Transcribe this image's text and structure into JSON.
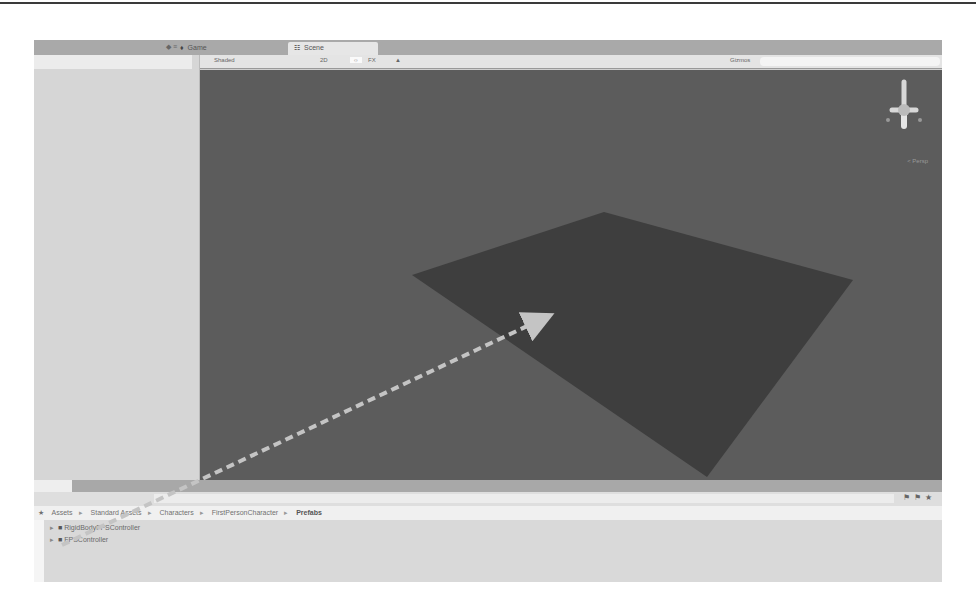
{
  "tabs": {
    "game": {
      "icon": "game-controller-icon",
      "label": "Game"
    },
    "scene": {
      "icon": "scene-icon",
      "label": "Scene",
      "active": true
    }
  },
  "scene_toolbar": {
    "shading_mode": "Shaded",
    "toggle_2d": "2D",
    "lighting_icon": "sun-icon",
    "audio_label": "FX",
    "audio_icon": "speaker-icon",
    "gizmos": "Gizmos",
    "search_placeholder": ""
  },
  "scene_view": {
    "projection_label": "< Persp",
    "gizmo_axes": [
      "x",
      "y",
      "z"
    ],
    "colors": {
      "background": "#5c5c5c",
      "plane": "#3e3e3e",
      "arrow": "#bdbdbd"
    }
  },
  "project": {
    "breadcrumb": [
      "Assets",
      "Standard Assets",
      "Characters",
      "FirstPersonCharacter",
      "Prefabs"
    ],
    "items": [
      {
        "name": "RigidBodyFPSController"
      },
      {
        "name": "FPSController"
      }
    ],
    "toolbar_icons": [
      "filter-by-type-icon",
      "filter-by-label-icon",
      "favorite-icon"
    ]
  }
}
